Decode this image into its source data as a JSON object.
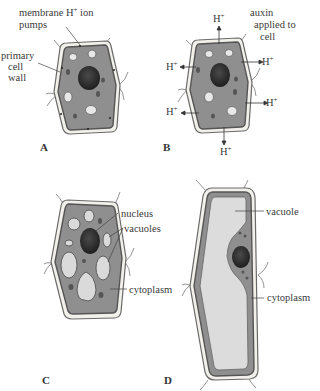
{
  "diagram": {
    "type": "plant cell elongation by auxin (acid growth)",
    "panels": [
      {
        "id": "A",
        "label": "A",
        "labels": {
          "pumps_line1": "membrane H",
          "pumps_sup": "+",
          "pumps_rest": " ion",
          "pumps_line2": "pumps",
          "wall_line1": "primary",
          "wall_line2": "cell",
          "wall_line3": "wall"
        }
      },
      {
        "id": "B",
        "label": "B",
        "labels": {
          "auxin_line1": "auxin",
          "auxin_line2": "applied to",
          "auxin_line3": "cell",
          "proton": "H",
          "proton_sup": "+"
        },
        "proton_arrows": 7
      },
      {
        "id": "C",
        "label": "C",
        "labels": {
          "nucleus": "nucleus",
          "vacuoles": "vacuoles",
          "cytoplasm": "cytoplasm"
        }
      },
      {
        "id": "D",
        "label": "D",
        "labels": {
          "vacuole": "vacuole",
          "cytoplasm": "cytoplasm"
        }
      }
    ],
    "colors": {
      "cell_wall": "#f2f0ea",
      "wall_outline": "#6a6a6a",
      "membrane": "#5c5c5c",
      "cytoplasm": "#8f8f8f",
      "vacuole": "#dadada",
      "nucleus": "#2e2e2e",
      "organelle": "#555555"
    }
  }
}
